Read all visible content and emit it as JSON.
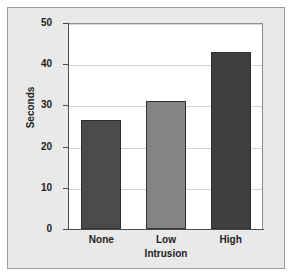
{
  "chart_data": {
    "type": "bar",
    "title": "",
    "subtitle": "",
    "categories": [
      "None",
      "Low",
      "High"
    ],
    "values": [
      26.5,
      31,
      43
    ],
    "series": [
      {
        "name": "Seconds",
        "values": [
          26.5,
          31,
          43
        ]
      }
    ],
    "xlabel": "Intrusion",
    "ylabel": "Seconds",
    "ylim": [
      0,
      50
    ],
    "yticks": [
      0,
      10,
      20,
      30,
      40,
      50
    ],
    "ytick_labels": [
      "0",
      "10",
      "20",
      "30",
      "40",
      "50"
    ],
    "grid": "horizontal",
    "legend": "none",
    "bar_colors": [
      "#4b4b4b",
      "#848484",
      "#3f3f3f"
    ],
    "bar_edge_color": "#2f2f2f",
    "plot_background": "#ffffff",
    "figure_background": "#e9e9e9",
    "gridline_color": "#d2d2d2",
    "axis_color": "#4d4d4d"
  },
  "axes": {
    "y_title": "Seconds",
    "x_title": "Intrusion"
  }
}
